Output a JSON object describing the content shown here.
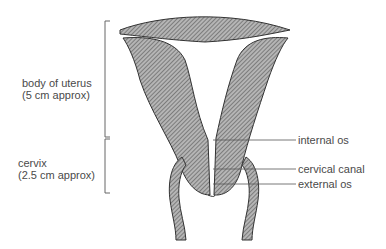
{
  "diagram": {
    "left_labels": [
      {
        "line1": "body of uterus",
        "line2": "(5 cm approx)"
      },
      {
        "line1": "cervix",
        "line2": "(2.5 cm approx)"
      }
    ],
    "right_labels": [
      {
        "text": "internal os"
      },
      {
        "text": "cervical canal"
      },
      {
        "text": "external os"
      }
    ],
    "colors": {
      "stroke": "#333333",
      "fill": "#8a8a8a",
      "text": "#4a4a4a"
    }
  }
}
